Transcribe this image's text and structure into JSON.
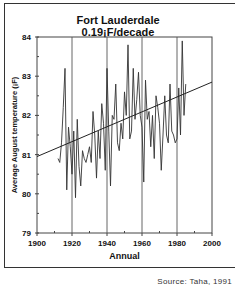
{
  "chart_data": {
    "type": "line",
    "title": "Fort Lauderdale",
    "subtitle": "0.19¡F/decade",
    "xlabel": "Annual",
    "ylabel": "Average August temperature (¡F)",
    "xlim": [
      1900,
      2000
    ],
    "ylim": [
      79,
      84
    ],
    "xticks": [
      1900,
      1920,
      1940,
      1960,
      1980,
      2000
    ],
    "yticks": [
      79,
      80,
      81,
      82,
      83,
      84
    ],
    "grid": "vertical lines at 1920, 1940, 1960, 1980",
    "series": [
      {
        "name": "Average August temperature",
        "x": [
          1912,
          1913,
          1914,
          1915,
          1916,
          1917,
          1918,
          1919,
          1920,
          1921,
          1922,
          1923,
          1924,
          1925,
          1926,
          1927,
          1928,
          1929,
          1930,
          1931,
          1932,
          1933,
          1934,
          1935,
          1936,
          1937,
          1938,
          1939,
          1940,
          1941,
          1942,
          1943,
          1944,
          1945,
          1946,
          1947,
          1948,
          1949,
          1950,
          1951,
          1952,
          1953,
          1954,
          1955,
          1956,
          1957,
          1958,
          1959,
          1960,
          1961,
          1962,
          1963,
          1964,
          1965,
          1966,
          1967,
          1968,
          1969,
          1970,
          1971,
          1972,
          1973,
          1974,
          1975,
          1976,
          1977,
          1978,
          1979,
          1980,
          1981,
          1982,
          1983,
          1984,
          1985
        ],
        "values": [
          80.9,
          80.8,
          81.3,
          82.2,
          83.2,
          80.1,
          81.7,
          81.2,
          80.5,
          81.6,
          79.9,
          81.9,
          80.7,
          80.2,
          81.1,
          80.9,
          80.8,
          81.0,
          81.2,
          80.8,
          82.1,
          81.5,
          80.4,
          81.6,
          80.9,
          82.3,
          81.8,
          80.6,
          83.2,
          81.6,
          80.2,
          82.0,
          81.9,
          82.8,
          81.3,
          81.1,
          81.8,
          81.4,
          82.6,
          82.0,
          83.8,
          81.4,
          81.6,
          83.2,
          81.9,
          82.4,
          83.1,
          82.0,
          81.7,
          80.3,
          82.9,
          81.9,
          82.1,
          81.2,
          82.0,
          80.9,
          82.5,
          82.2,
          81.8,
          80.6,
          81.5,
          82.5,
          81.5,
          81.3,
          82.8,
          81.6,
          81.5,
          81.3,
          81.4,
          82.7,
          81.5,
          83.9,
          82.0,
          82.8
        ]
      },
      {
        "name": "Linear trend",
        "x": [
          1900,
          2000
        ],
        "values": [
          80.95,
          82.85
        ]
      }
    ],
    "source": "Source: Taha, 1991"
  },
  "labels": {
    "title": "Fort Lauderdale",
    "subtitle": "0.19¡F/decade",
    "xlabel": "Annual",
    "ylabel": "Average August temperature (¡F)",
    "source": "Source: Taha, 1991"
  }
}
